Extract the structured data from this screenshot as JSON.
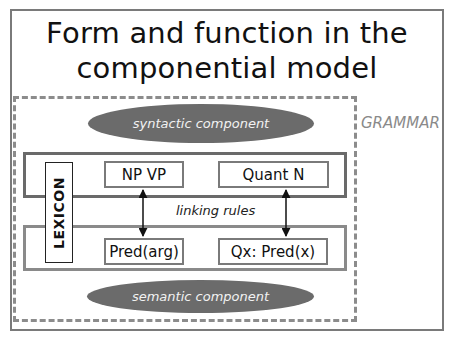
{
  "slide": {
    "title_line1": "Form and function in the",
    "title_line2": "componential model"
  },
  "diagram": {
    "grammar_label": "GRAMMAR",
    "syntactic_component": "syntactic component",
    "semantic_component": "semantic component",
    "lexicon_label": "LEXICON",
    "linking_rules": "linking rules",
    "syntax_terms": [
      "NP VP",
      "Quant N"
    ],
    "semantic_terms": [
      "Pred(arg)",
      "Qx: Pred(x)"
    ],
    "links": [
      {
        "from": "NP VP",
        "to": "Pred(arg)",
        "type": "bidirectional-arrow"
      },
      {
        "from": "Quant N",
        "to": "Qx: Pred(x)",
        "type": "bidirectional-arrow"
      }
    ],
    "colors": {
      "ellipse_fill": "#6b6b6b",
      "ellipse_text": "#f2f2f2",
      "dashed_border": "#8c8c8c",
      "grammar_text": "#8a8a8a",
      "syntax_band_border": "#6a6a6a",
      "semantic_band_border": "#8a8a8a"
    }
  }
}
